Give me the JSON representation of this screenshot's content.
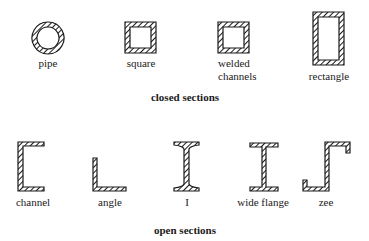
{
  "closed_sections": {
    "caption": "closed sections",
    "items": [
      {
        "id": "pipe",
        "label": "pipe"
      },
      {
        "id": "square",
        "label": "square"
      },
      {
        "id": "welded-channels",
        "label_line1": "welded",
        "label_line2": "channels"
      },
      {
        "id": "rectangle",
        "label": "rectangle"
      }
    ]
  },
  "open_sections": {
    "caption": "open sections",
    "items": [
      {
        "id": "channel",
        "label": "channel"
      },
      {
        "id": "angle",
        "label": "angle"
      },
      {
        "id": "i-beam",
        "label": "I"
      },
      {
        "id": "wide-flange",
        "label": "wide flange"
      },
      {
        "id": "zee",
        "label": "zee"
      }
    ]
  },
  "style": {
    "stroke": "#1a1a1a",
    "hatch": "#1a1a1a",
    "background": "#ffffff"
  }
}
